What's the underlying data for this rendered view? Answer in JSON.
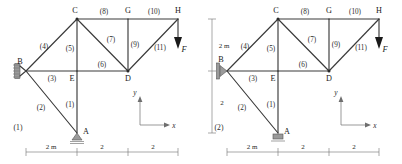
{
  "figure": {
    "kind": "truss-structure-diagram",
    "panels": [
      {
        "number": "(1)",
        "support_B": "roller-hatched-wall",
        "support_A": "pin-triangle-ground",
        "nodes": [
          {
            "id": "B",
            "label": "B",
            "x": 0,
            "y": 2
          },
          {
            "id": "A",
            "label": "A",
            "x": 2,
            "y": 0
          },
          {
            "id": "E",
            "label": "E",
            "x": 2,
            "y": 2
          },
          {
            "id": "C",
            "label": "C",
            "x": 2,
            "y": 4
          },
          {
            "id": "D",
            "label": "D",
            "x": 4,
            "y": 2
          },
          {
            "id": "G",
            "label": "G",
            "x": 4,
            "y": 4
          },
          {
            "id": "H",
            "label": "H",
            "x": 6,
            "y": 4
          }
        ],
        "members": [
          {
            "label": "(1)",
            "from": "A",
            "to": "E"
          },
          {
            "label": "(2)",
            "from": "B",
            "to": "A"
          },
          {
            "label": "(3)",
            "from": "B",
            "to": "E"
          },
          {
            "label": "(4)",
            "from": "B",
            "to": "C"
          },
          {
            "label": "(5)",
            "from": "C",
            "to": "E"
          },
          {
            "label": "(6)",
            "from": "E",
            "to": "D"
          },
          {
            "label": "(7)",
            "from": "C",
            "to": "D"
          },
          {
            "label": "(8)",
            "from": "C",
            "to": "G"
          },
          {
            "label": "(9)",
            "from": "G",
            "to": "D"
          },
          {
            "label": "(10)",
            "from": "G",
            "to": "H"
          },
          {
            "label": "(11)",
            "from": "D",
            "to": "H"
          }
        ],
        "load": {
          "label": "F",
          "at": "H",
          "direction": "down"
        },
        "axes": {
          "x_label": "x",
          "y_label": "y"
        },
        "horizontal_dims": [
          "2 m",
          "2",
          "2"
        ]
      },
      {
        "number": "(2)",
        "support_B": "pin-triangle-wall",
        "support_A": "roller-slider-ground",
        "nodes": [
          {
            "id": "B",
            "label": "B",
            "x": 0,
            "y": 2
          },
          {
            "id": "A",
            "label": "A",
            "x": 2,
            "y": 0
          },
          {
            "id": "E",
            "label": "E",
            "x": 2,
            "y": 2
          },
          {
            "id": "C",
            "label": "C",
            "x": 2,
            "y": 4
          },
          {
            "id": "D",
            "label": "D",
            "x": 4,
            "y": 2
          },
          {
            "id": "G",
            "label": "G",
            "x": 4,
            "y": 4
          },
          {
            "id": "H",
            "label": "H",
            "x": 6,
            "y": 4
          }
        ],
        "members": [
          {
            "label": "(1)",
            "from": "A",
            "to": "E"
          },
          {
            "label": "(2)",
            "from": "B",
            "to": "A"
          },
          {
            "label": "(3)",
            "from": "B",
            "to": "E"
          },
          {
            "label": "(4)",
            "from": "B",
            "to": "C"
          },
          {
            "label": "(5)",
            "from": "C",
            "to": "E"
          },
          {
            "label": "(6)",
            "from": "E",
            "to": "D"
          },
          {
            "label": "(7)",
            "from": "C",
            "to": "D"
          },
          {
            "label": "(8)",
            "from": "C",
            "to": "G"
          },
          {
            "label": "(9)",
            "from": "G",
            "to": "D"
          },
          {
            "label": "(10)",
            "from": "G",
            "to": "H"
          },
          {
            "label": "(11)",
            "from": "D",
            "to": "H"
          }
        ],
        "load": {
          "label": "F",
          "at": "H",
          "direction": "down"
        },
        "axes": {
          "x_label": "x",
          "y_label": "y"
        },
        "horizontal_dims": [
          "2 m",
          "2",
          "2"
        ]
      }
    ],
    "vertical_dims": {
      "upper": "2 m",
      "lower": "2"
    },
    "colors": {
      "member": "#3a3a3a",
      "dimension": "#6e6e6e",
      "text": "#1a1a1a"
    }
  }
}
